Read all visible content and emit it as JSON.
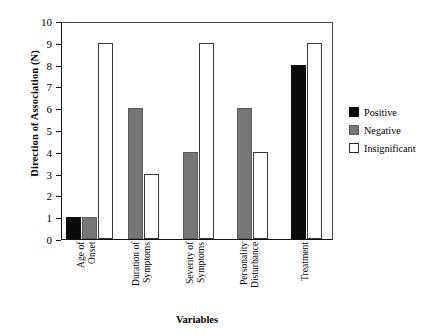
{
  "chart_data": {
    "type": "bar",
    "title": "",
    "xlabel": "Variables",
    "ylabel": "Direction of Association (N)",
    "ylim": [
      0,
      10
    ],
    "yticks": [
      0,
      1,
      2,
      3,
      4,
      5,
      6,
      7,
      8,
      9,
      10
    ],
    "grid": false,
    "legend_position": "right",
    "categories": [
      "Age of Onset",
      "Duration of Symptoms",
      "Severity of Symptoms",
      "Personality Disturbance",
      "Treatment"
    ],
    "category_lines": [
      [
        "Age of",
        "Onset"
      ],
      [
        "Duration of",
        "Symptoms"
      ],
      [
        "Severity of",
        "Symptoms"
      ],
      [
        "Personality",
        "Disturbance"
      ],
      [
        "Treatment"
      ]
    ],
    "series": [
      {
        "name": "Positive",
        "color": "#0a0a0a",
        "values": [
          1,
          0,
          0,
          0,
          8
        ]
      },
      {
        "name": "Negative",
        "color": "#767676",
        "values": [
          1,
          6,
          4,
          6,
          0
        ]
      },
      {
        "name": "Insignificant",
        "color": "#ffffff",
        "values": [
          9,
          3,
          9,
          4,
          9
        ]
      }
    ]
  },
  "axes": {
    "y_title": "Direction of Association (N)",
    "x_title": "Variables",
    "y_tick_labels": [
      "10",
      "9",
      "8",
      "7",
      "6",
      "5",
      "4",
      "3",
      "2",
      "1",
      "0"
    ]
  },
  "legend": {
    "items": [
      {
        "label": "Positive",
        "swatch": "positive"
      },
      {
        "label": "Negative",
        "swatch": "negative"
      },
      {
        "label": "Insignificant",
        "swatch": "insignificant"
      }
    ]
  },
  "colors": {
    "positive": "#0a0a0a",
    "negative": "#767676",
    "insignificant": "#ffffff",
    "axis": "#111111",
    "background": "#ffffff"
  }
}
